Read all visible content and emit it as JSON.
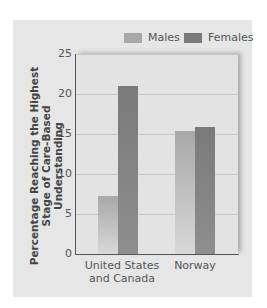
{
  "chart_data": {
    "type": "bar",
    "title": "",
    "xlabel": "",
    "ylabel": "Percentage Reaching the Highest Stage of Care-Based Understanding",
    "ylabel_lines": [
      "Percentage Reaching the Highest",
      "Stage of Care-Based Understanding"
    ],
    "categories": [
      "United States and Canada",
      "Norway"
    ],
    "category_lines": [
      [
        "United States",
        "and Canada"
      ],
      [
        "Norway"
      ]
    ],
    "series": [
      {
        "name": "Males",
        "values": [
          7.3,
          15.4
        ],
        "color": "#a8a8a8"
      },
      {
        "name": "Females",
        "values": [
          21.0,
          15.9
        ],
        "color": "#7a7a7a"
      }
    ],
    "ylim": [
      0,
      25
    ],
    "yticks": [
      0,
      5,
      10,
      15,
      20,
      25
    ],
    "grid": true,
    "legend_position": "top-right"
  }
}
